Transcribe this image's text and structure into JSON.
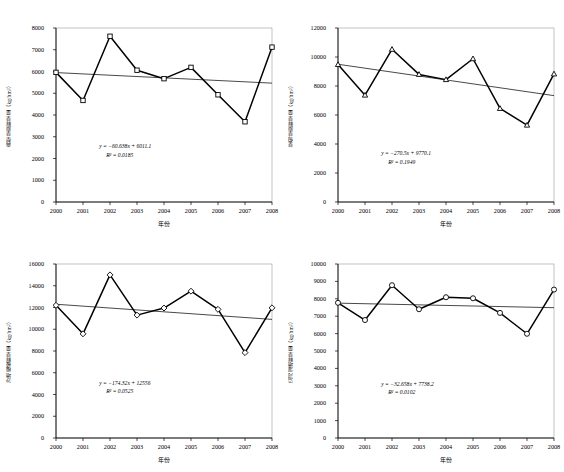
{
  "figure": {
    "background": "#ffffff",
    "line_color": "#000000",
    "trend_color": "#1a1a1a",
    "frame_color": "#9a9a9a",
    "marker_fill": "#ffffff"
  },
  "chart_data": [
    {
      "id": "typical-steppe",
      "position": "top-left",
      "type": "line",
      "title": "",
      "xlabel": "年份",
      "ylabel": "典型草原鲜草量（kg/hm²）",
      "categories": [
        "2000",
        "2001",
        "2002",
        "2003",
        "2004",
        "2005",
        "2006",
        "2007",
        "2008"
      ],
      "x": [
        2000,
        2001,
        2002,
        2003,
        2004,
        2005,
        2006,
        2007,
        2008
      ],
      "values": [
        5960,
        4670,
        7620,
        6060,
        5670,
        6190,
        4930,
        3690,
        7120
      ],
      "marker": "square",
      "ylim": [
        0,
        8000
      ],
      "yticks": [
        0,
        1000,
        2000,
        3000,
        4000,
        5000,
        6000,
        7000,
        8000
      ],
      "ytick_labels": [
        "0",
        "1000",
        "2000",
        "3000",
        "4000",
        "5000",
        "6000",
        "7000",
        "8000"
      ],
      "grid": false,
      "legend": "none",
      "trendline": {
        "equation": "y = −60.638x + 6011.1",
        "r2": "R² = 0.0185",
        "slope": -60.638,
        "intercept": 6011.1,
        "y_start": 5950,
        "y_end": 5465
      }
    },
    {
      "id": "meadow-steppe",
      "position": "top-right",
      "type": "line",
      "title": "",
      "xlabel": "年份",
      "ylabel": "草甸草原鲜草量（kg/hm²）",
      "categories": [
        "2000",
        "2001",
        "2002",
        "2003",
        "2004",
        "2005",
        "2006",
        "2007",
        "2008"
      ],
      "x": [
        2000,
        2001,
        2002,
        2003,
        2004,
        2005,
        2006,
        2007,
        2008
      ],
      "values": [
        9480,
        7370,
        10530,
        8800,
        8440,
        9880,
        6450,
        5300,
        8830
      ],
      "marker": "triangle",
      "ylim": [
        0,
        12000
      ],
      "yticks": [
        0,
        2000,
        4000,
        6000,
        8000,
        10000,
        12000
      ],
      "ytick_labels": [
        "0",
        "2000",
        "4000",
        "6000",
        "8000",
        "10000",
        "12000"
      ],
      "grid": false,
      "legend": "none",
      "trendline": {
        "equation": "y = −270.5x + 9770.1",
        "r2": "R² = 0.1949",
        "slope": -270.5,
        "intercept": 9770.1,
        "y_start": 9500,
        "y_end": 7336
      }
    },
    {
      "id": "sandy-land",
      "position": "bottom-left",
      "type": "line",
      "title": "",
      "xlabel": "年份",
      "ylabel": "沙地植被鲜草量（kg/hm²）",
      "categories": [
        "2000",
        "2001",
        "2002",
        "2003",
        "2004",
        "2005",
        "2006",
        "2007",
        "2008"
      ],
      "x": [
        2000,
        2001,
        2002,
        2003,
        2004,
        2005,
        2006,
        2007,
        2008
      ],
      "values": [
        12200,
        9580,
        15000,
        11300,
        11950,
        13500,
        11830,
        7850,
        11970
      ],
      "marker": "diamond",
      "ylim": [
        0,
        16000
      ],
      "yticks": [
        0,
        2000,
        4000,
        6000,
        8000,
        10000,
        12000,
        14000,
        16000
      ],
      "ytick_labels": [
        "0",
        "2000",
        "4000",
        "6000",
        "8000",
        "10000",
        "12000",
        "14000",
        "16000"
      ],
      "grid": false,
      "legend": "none",
      "trendline": {
        "equation": "y = −174.32x + 12556",
        "r2": "R² = 0.0525",
        "slope": -174.32,
        "intercept": 12556,
        "y_start": 12300,
        "y_end": 10906
      }
    },
    {
      "id": "riverside-wetland",
      "position": "bottom-right",
      "type": "line",
      "title": "",
      "xlabel": "年份",
      "ylabel": "沿河湿地鲜草量（kg/hm²）",
      "categories": [
        "2000",
        "2001",
        "2002",
        "2003",
        "2004",
        "2005",
        "2006",
        "2007",
        "2008"
      ],
      "x": [
        2000,
        2001,
        2002,
        2003,
        2004,
        2005,
        2006,
        2007,
        2008
      ],
      "values": [
        7770,
        6780,
        8780,
        7400,
        8090,
        8030,
        7190,
        5990,
        8530
      ],
      "marker": "circle",
      "ylim": [
        0,
        10000
      ],
      "yticks": [
        0,
        1000,
        2000,
        3000,
        4000,
        5000,
        6000,
        7000,
        8000,
        9000,
        10000
      ],
      "ytick_labels": [
        "0",
        "1000",
        "2000",
        "3000",
        "4000",
        "5000",
        "6000",
        "7000",
        "8000",
        "9000",
        "10000"
      ],
      "grid": false,
      "legend": "none",
      "trendline": {
        "equation": "y = −32.658x + 7738.2",
        "r2": "R² = 0.0102",
        "slope": -32.658,
        "intercept": 7738.2,
        "y_start": 7750,
        "y_end": 7489
      }
    }
  ]
}
